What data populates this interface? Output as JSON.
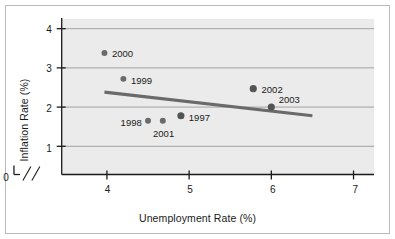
{
  "chart_data": {
    "type": "scatter",
    "title": "",
    "xlabel": "Unemployment Rate (%)",
    "ylabel": "Inflation Rate (%)",
    "xlim": [
      3.45,
      7.25
    ],
    "ylim": [
      0.28,
      4.25
    ],
    "xticks": [
      0,
      4,
      5,
      6,
      7
    ],
    "xtick_labels": [
      "0",
      "4",
      "5",
      "6",
      "7"
    ],
    "yticks": [
      0,
      1,
      2,
      3,
      4
    ],
    "ytick_labels": [
      "0",
      "1",
      "2",
      "3",
      "4"
    ],
    "grid": "horizontal",
    "axis_break": {
      "x": true,
      "y": true,
      "marks": 2
    },
    "points": [
      {
        "label": "1997",
        "x": 4.9,
        "y": 1.78,
        "label_pos": "right",
        "size": "large"
      },
      {
        "label": "1998",
        "x": 4.5,
        "y": 1.65,
        "label_pos": "left",
        "size": "small"
      },
      {
        "label": "1999",
        "x": 4.2,
        "y": 2.72,
        "label_pos": "right",
        "size": "small"
      },
      {
        "label": "2000",
        "x": 3.97,
        "y": 3.38,
        "label_pos": "right",
        "size": "small"
      },
      {
        "label": "2001",
        "x": 4.68,
        "y": 1.65,
        "label_pos": "below",
        "size": "small"
      },
      {
        "label": "2002",
        "x": 5.78,
        "y": 2.47,
        "label_pos": "right",
        "size": "large"
      },
      {
        "label": "2003",
        "x": 6.0,
        "y": 2.0,
        "label_pos": "right-above",
        "size": "large"
      }
    ],
    "trendline": {
      "x0": 3.97,
      "y0": 2.38,
      "x1": 6.5,
      "y1": 1.78
    },
    "colors": {
      "plot_background": "#ebebeb",
      "gridline": "#9a9a9a",
      "axis": "#1a1a1a",
      "marker": "#6b6b6b",
      "marker_dark": "#545454",
      "trendline": "#6a6a6a",
      "frame_border": "#b9b9b9",
      "page_background": "#ffffff"
    }
  }
}
